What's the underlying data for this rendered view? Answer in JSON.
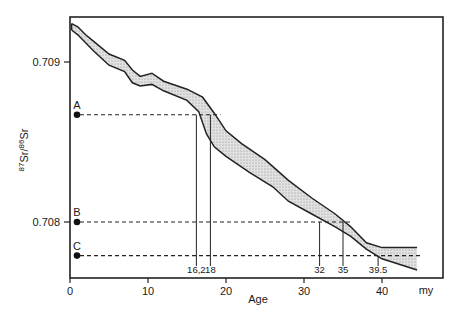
{
  "chart_data": {
    "type": "area",
    "title": "",
    "xlabel": "Age",
    "x_unit": "my",
    "ylabel_parts": {
      "sup1": "87",
      "base1": "Sr",
      "sup2": "86",
      "base2": "Sr"
    },
    "xlim": [
      0,
      45
    ],
    "ylim": [
      0.70765,
      0.70929
    ],
    "grid": false,
    "x_ticks": [
      0,
      10,
      20,
      30,
      40
    ],
    "x_tick_labels": [
      "0",
      "10",
      "20",
      "30",
      "40"
    ],
    "y_ticks": [
      0.709,
      0.708
    ],
    "y_tick_labels": [
      "0.709",
      "0.708"
    ],
    "band": {
      "name": "Seawater 87Sr/86Sr envelope",
      "fill": "#c8c8c8",
      "stroke": "#222222",
      "upper": [
        [
          0.2,
          0.70924
        ],
        [
          1,
          0.70922
        ],
        [
          2,
          0.70917
        ],
        [
          3,
          0.70913
        ],
        [
          5,
          0.70905
        ],
        [
          7,
          0.70901
        ],
        [
          8,
          0.70895
        ],
        [
          9,
          0.70891
        ],
        [
          10.5,
          0.70893
        ],
        [
          12,
          0.70888
        ],
        [
          15,
          0.70883
        ],
        [
          17,
          0.70878
        ],
        [
          18.5,
          0.70868
        ],
        [
          20,
          0.70857
        ],
        [
          22,
          0.70849
        ],
        [
          25,
          0.70839
        ],
        [
          28,
          0.70826
        ],
        [
          31,
          0.70815
        ],
        [
          34,
          0.70805
        ],
        [
          36,
          0.70797
        ],
        [
          38,
          0.70787
        ],
        [
          40,
          0.70784
        ],
        [
          44.5,
          0.70784
        ]
      ],
      "lower": [
        [
          0.2,
          0.7092
        ],
        [
          1,
          0.70917
        ],
        [
          3,
          0.70907
        ],
        [
          5,
          0.70898
        ],
        [
          7,
          0.70894
        ],
        [
          8,
          0.70887
        ],
        [
          9,
          0.70885
        ],
        [
          10.5,
          0.70886
        ],
        [
          12,
          0.70882
        ],
        [
          15,
          0.70876
        ],
        [
          16.5,
          0.70869
        ],
        [
          17.5,
          0.70855
        ],
        [
          18.5,
          0.70847
        ],
        [
          20,
          0.70841
        ],
        [
          23,
          0.70831
        ],
        [
          26,
          0.70822
        ],
        [
          28,
          0.70813
        ],
        [
          31,
          0.70805
        ],
        [
          34,
          0.70797
        ],
        [
          36,
          0.70791
        ],
        [
          38,
          0.70783
        ],
        [
          40,
          0.70777
        ],
        [
          44.5,
          0.7077
        ]
      ]
    },
    "samples": [
      {
        "label": "A",
        "ratio": 0.70867,
        "age_range": [
          16.2,
          18
        ],
        "dash_end_age": 19.3
      },
      {
        "label": "B",
        "ratio": 0.708,
        "age_range": [
          32,
          35
        ],
        "dash_end_age": 36.2
      },
      {
        "label": "C",
        "ratio": 0.70779,
        "age_range": [
          39.5
        ],
        "dash_end_age": 45
      }
    ],
    "annotations": [
      "16.2",
      "18",
      "32",
      "35",
      "39.5"
    ]
  }
}
